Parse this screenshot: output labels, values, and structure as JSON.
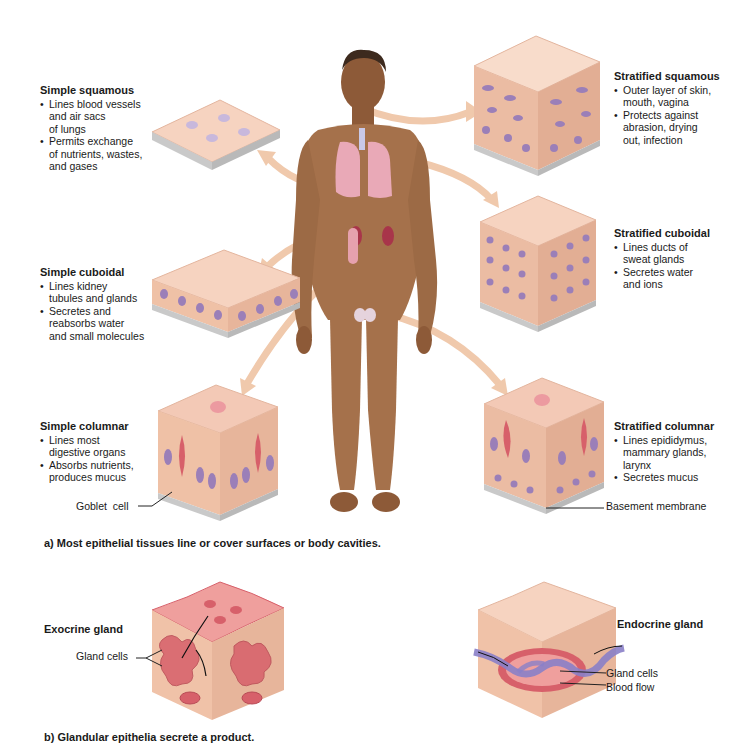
{
  "figure": {
    "part_a_caption": "a) Most epithelial tissues line or cover surfaces or body cavities.",
    "part_b_caption": "b) Glandular epithelia secrete a product."
  },
  "tissues": {
    "simple_squamous": {
      "title": "Simple squamous",
      "bullets": [
        "Lines blood vessels and air sacs of lungs",
        "Permits exchange of nutrients, wastes, and gases"
      ],
      "bullet_lines": [
        [
          "Lines blood vessels",
          "and air sacs",
          "of lungs"
        ],
        [
          "Permits exchange",
          "of nutrients, wastes,",
          "and gases"
        ]
      ]
    },
    "simple_cuboidal": {
      "title": "Simple cuboidal",
      "bullet_lines": [
        [
          "Lines kidney",
          "tubules and glands"
        ],
        [
          "Secretes and",
          "reabsorbs water",
          "and small molecules"
        ]
      ]
    },
    "simple_columnar": {
      "title": "Simple columnar",
      "bullet_lines": [
        [
          "Lines most",
          "digestive organs"
        ],
        [
          "Absorbs nutrients,",
          "produces mucus"
        ]
      ],
      "pointer_label": "Goblet  cell"
    },
    "stratified_squamous": {
      "title": "Stratified squamous",
      "bullet_lines": [
        [
          "Outer layer of skin,",
          "mouth, vagina"
        ],
        [
          "Protects against",
          "abrasion, drying",
          "out, infection"
        ]
      ]
    },
    "stratified_cuboidal": {
      "title": "Stratified cuboidal",
      "bullet_lines": [
        [
          "Lines ducts of",
          "sweat glands"
        ],
        [
          "Secretes water",
          "and ions"
        ]
      ]
    },
    "stratified_columnar": {
      "title": "Stratified columnar",
      "bullet_lines": [
        [
          "Lines epididymus,",
          "mammary glands,",
          "larynx"
        ],
        [
          "Secretes mucus"
        ]
      ],
      "pointer_label": "Basement membrane"
    }
  },
  "glands": {
    "exocrine": {
      "title": "Exocrine gland",
      "pointer_label": "Gland cells"
    },
    "endocrine": {
      "title": "Endocrine gland",
      "pointer_labels": [
        "Gland cells",
        "Blood flow"
      ]
    }
  },
  "colors": {
    "skin": "#a5714b",
    "tissue_top": "#f6d3c0",
    "tissue_side": "#e7b59b",
    "nucleus": "#9b7fb8",
    "arrow": "#f0c9ac",
    "gland_red": "#d7606a",
    "gland_pink": "#ef9f9d",
    "vessel_purple": "#8a7fc8",
    "basement": "#c9c9c9",
    "lung": "#e9a9b7"
  }
}
